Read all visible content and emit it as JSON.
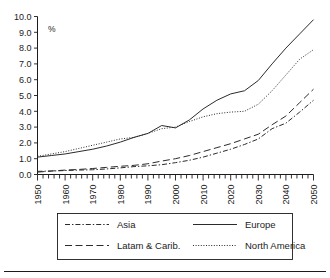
{
  "chart_data": {
    "type": "line",
    "title": "",
    "subtitle": "",
    "xlabel": "",
    "ylabel": "%",
    "unit_label": "%",
    "xlim": [
      1950,
      2050
    ],
    "ylim": [
      0.0,
      10.0
    ],
    "grid": false,
    "legend_position": "bottom",
    "x_ticks": [
      1950,
      1960,
      1970,
      1980,
      1990,
      2000,
      2010,
      2020,
      2030,
      2040,
      2050
    ],
    "x_tick_labels": [
      "1950",
      "1960",
      "1970",
      "1980",
      "1990",
      "2000",
      "2010",
      "2020",
      "2030",
      "2040",
      "2050"
    ],
    "x_minor_tick_step": 2,
    "y_ticks": [
      0.0,
      1.0,
      2.0,
      3.0,
      4.0,
      5.0,
      6.0,
      7.0,
      8.0,
      9.0,
      10.0
    ],
    "y_tick_labels": [
      "0.0",
      "1.0",
      "2.0",
      "3.0",
      "4.0",
      "5.0",
      "6.0",
      "7.0",
      "8.0",
      "9.0",
      "10.0"
    ],
    "x": [
      1950,
      1955,
      1960,
      1965,
      1970,
      1975,
      1980,
      1985,
      1990,
      1995,
      2000,
      2005,
      2010,
      2015,
      2020,
      2025,
      2030,
      2035,
      2040,
      2045,
      2050
    ],
    "series": [
      {
        "name": "Asia",
        "label": "Asia",
        "line_style": "dash-dot",
        "color": "#2b2b2b",
        "values": [
          0.2,
          0.22,
          0.25,
          0.28,
          0.3,
          0.35,
          0.42,
          0.5,
          0.55,
          0.62,
          0.75,
          0.9,
          1.1,
          1.35,
          1.6,
          1.9,
          2.25,
          2.9,
          3.25,
          3.95,
          4.7
        ]
      },
      {
        "name": "Europe",
        "label": "Europe",
        "line_style": "solid",
        "color": "#2b2b2b",
        "values": [
          1.1,
          1.2,
          1.3,
          1.45,
          1.6,
          1.8,
          2.05,
          2.35,
          2.6,
          3.1,
          2.95,
          3.45,
          4.15,
          4.7,
          5.1,
          5.3,
          5.95,
          7.0,
          8.0,
          8.9,
          9.8
        ]
      },
      {
        "name": "Latam & Carib.",
        "label": "Latam & Carib.",
        "line_style": "long-dash",
        "color": "#2b2b2b",
        "values": [
          0.15,
          0.22,
          0.28,
          0.32,
          0.38,
          0.45,
          0.52,
          0.58,
          0.68,
          0.85,
          1.0,
          1.2,
          1.45,
          1.7,
          1.95,
          2.25,
          2.55,
          3.15,
          3.7,
          4.55,
          5.4
        ]
      },
      {
        "name": "North America",
        "label": "North America",
        "line_style": "dotted",
        "color": "#2b2b2b",
        "values": [
          1.15,
          1.3,
          1.45,
          1.65,
          1.85,
          2.05,
          2.25,
          2.35,
          2.6,
          2.9,
          3.0,
          3.35,
          3.65,
          3.85,
          3.95,
          4.0,
          4.45,
          5.3,
          6.3,
          7.3,
          7.9
        ]
      }
    ],
    "legend_entries": [
      {
        "label": "Asia",
        "line_style": "dash-dot"
      },
      {
        "label": "Europe",
        "line_style": "solid"
      },
      {
        "label": "Latam & Carib.",
        "line_style": "long-dash"
      },
      {
        "label": "North America",
        "line_style": "dotted"
      }
    ]
  }
}
